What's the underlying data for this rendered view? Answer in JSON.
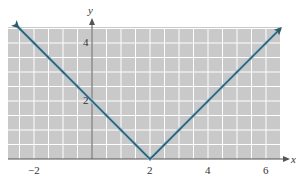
{
  "chart_data": {
    "type": "line",
    "title": "",
    "function": "y = |x - 2|",
    "xlabel": "x",
    "ylabel": "y",
    "xlim": [
      -3,
      6.5
    ],
    "ylim": [
      0,
      4.5
    ],
    "grid": true,
    "grid_step": 0.5,
    "x_ticks": [
      {
        "value": -2,
        "label": "−2"
      },
      {
        "value": 2,
        "label": "2"
      },
      {
        "value": 4,
        "label": "4"
      },
      {
        "value": 6,
        "label": "6"
      }
    ],
    "y_ticks": [
      {
        "value": 2,
        "label": "2"
      },
      {
        "value": 4,
        "label": "4"
      }
    ],
    "series": [
      {
        "name": "y = |x - 2|",
        "x": [
          -2.55,
          0,
          2,
          4,
          6.5
        ],
        "y": [
          4.55,
          2,
          0,
          2,
          4.5
        ],
        "arrows": "both ends"
      }
    ],
    "annotations": [
      {
        "text": "y-intercept",
        "x": 0,
        "y": 2
      },
      {
        "text": "vertex",
        "x": 2,
        "y": 0
      }
    ]
  },
  "colors": {
    "plot_background": "#c9c9c9",
    "grid_lines": "#ffffff",
    "axis": "#555555",
    "line": "#2b5a6a",
    "line_halo": "#9fc6d8"
  },
  "labels": {
    "x_axis": "x",
    "y_axis": "y",
    "xtick_neg2": "−2",
    "xtick_2": "2",
    "xtick_4": "4",
    "xtick_6": "6",
    "ytick_2": "2",
    "ytick_4": "4"
  }
}
